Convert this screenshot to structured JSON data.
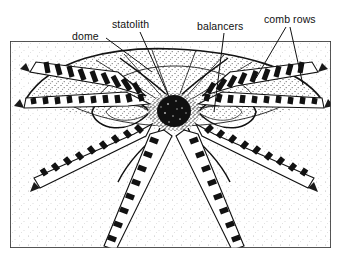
{
  "figure": {
    "background_color": "#ffffff",
    "ink_color": "#111111",
    "frame": {
      "x": 10,
      "y": 41,
      "width": 321,
      "height": 207,
      "border_color": "#3a3a3a"
    }
  },
  "labels": [
    {
      "id": "dome",
      "text": "dome",
      "x": 72,
      "y": 31,
      "leader": {
        "from_x": 106,
        "from_y": 38,
        "to_x": 152,
        "to_y": 72
      }
    },
    {
      "id": "statolith",
      "text": "statolith",
      "x": 112,
      "y": 19,
      "leader": {
        "from_x": 140,
        "from_y": 32,
        "to_x": 170,
        "to_y": 99
      }
    },
    {
      "id": "balancers",
      "text": "balancers",
      "x": 197,
      "y": 21,
      "leader": {
        "from_x": 224,
        "from_y": 33,
        "to_x": 214,
        "to_y": 112
      }
    },
    {
      "id": "comb-rows",
      "text": "comb rows",
      "x": 264,
      "y": 14,
      "leaders": [
        {
          "from_x": 286,
          "from_y": 27,
          "to_x": 256,
          "to_y": 78
        },
        {
          "from_x": 290,
          "from_y": 27,
          "to_x": 303,
          "to_y": 85
        }
      ]
    }
  ],
  "structures": {
    "dome": {
      "apex_x": 175,
      "apex_y": 49,
      "left_x": 38,
      "right_x": 318,
      "base_y": 104
    },
    "statolith": {
      "cx": 174,
      "cy": 112,
      "rx": 17,
      "ry": 16,
      "fill": "#101010"
    },
    "balancer_loops": 4,
    "comb_rows_count": 8,
    "comb_row_segments_per_row": 8
  }
}
